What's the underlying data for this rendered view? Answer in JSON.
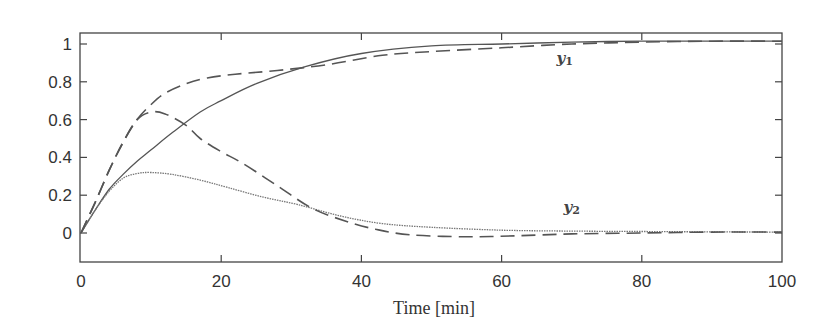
{
  "chart_data": {
    "type": "line",
    "title": "",
    "xlabel": "Time [min]",
    "ylabel": "",
    "xlim": [
      0,
      100
    ],
    "ylim": [
      -0.16,
      1.04
    ],
    "grid": false,
    "legend": null,
    "x_ticks": [
      0,
      20,
      40,
      60,
      80,
      100
    ],
    "x_tick_labels": [
      "0",
      "20",
      "40",
      "60",
      "80",
      "100"
    ],
    "y_ticks": [
      0,
      0.2,
      0.4,
      0.6,
      0.8,
      1
    ],
    "y_tick_labels": [
      "0",
      "0.2",
      "0.4",
      "0.6",
      "0.8",
      "1"
    ],
    "annotations": [
      {
        "text": "y",
        "sub": "1",
        "x": 69,
        "y": 0.9
      },
      {
        "text": "y",
        "sub": "2",
        "x": 70,
        "y": 0.11
      }
    ],
    "series": [
      {
        "name": "y1 (solid)",
        "style": "solid",
        "color": "#555555",
        "x": [
          0,
          2,
          4,
          6,
          8,
          10,
          13,
          17,
          20,
          25,
          32,
          40,
          50,
          60,
          70,
          80,
          90,
          100
        ],
        "y": [
          0,
          0.12,
          0.23,
          0.31,
          0.38,
          0.44,
          0.53,
          0.64,
          0.7,
          0.79,
          0.88,
          0.95,
          0.99,
          1.0,
          1.01,
          1.015,
          1.015,
          1.015
        ]
      },
      {
        "name": "y1 (dashed)",
        "style": "dashed",
        "color": "#555555",
        "x": [
          0,
          2,
          4,
          6,
          8,
          10,
          12,
          15,
          18,
          22,
          28,
          35,
          43,
          50,
          60,
          70,
          80,
          90,
          100
        ],
        "y": [
          0,
          0.16,
          0.33,
          0.48,
          0.6,
          0.68,
          0.74,
          0.79,
          0.82,
          0.84,
          0.86,
          0.89,
          0.94,
          0.96,
          0.98,
          1.0,
          1.01,
          1.015,
          1.015
        ]
      },
      {
        "name": "y2 (dotted)",
        "style": "dotted",
        "color": "#777777",
        "x": [
          0,
          2,
          4,
          6,
          8,
          10,
          13,
          17,
          21,
          26,
          31,
          37,
          43,
          50,
          60,
          70,
          80,
          90,
          100
        ],
        "y": [
          0,
          0.12,
          0.22,
          0.29,
          0.315,
          0.32,
          0.31,
          0.28,
          0.24,
          0.19,
          0.15,
          0.09,
          0.05,
          0.03,
          0.015,
          0.01,
          0.008,
          0.006,
          0.005
        ]
      },
      {
        "name": "y2 (dashed)",
        "style": "dashed",
        "color": "#555555",
        "x": [
          0,
          2,
          4,
          6,
          8,
          10,
          12,
          15,
          17,
          20,
          23,
          28,
          33,
          38,
          42,
          47,
          55,
          62,
          70,
          80,
          90,
          100
        ],
        "y": [
          0,
          0.16,
          0.33,
          0.48,
          0.6,
          0.64,
          0.63,
          0.57,
          0.5,
          0.43,
          0.37,
          0.25,
          0.13,
          0.06,
          0.02,
          -0.01,
          -0.02,
          -0.015,
          -0.005,
          0.0,
          0.005,
          0.005
        ]
      }
    ]
  }
}
